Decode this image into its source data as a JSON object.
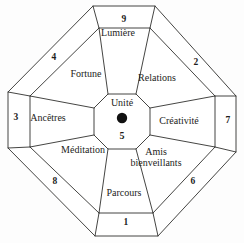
{
  "diagram": {
    "center": {
      "label": "Unité",
      "number": "5",
      "marker": "filled-dot"
    },
    "outer_numbers": [
      {
        "id": "north",
        "value": "9",
        "x": 124,
        "y": 20
      },
      {
        "id": "northeast",
        "value": "2",
        "x": 196,
        "y": 63
      },
      {
        "id": "east",
        "value": "7",
        "x": 228,
        "y": 121
      },
      {
        "id": "southeast",
        "value": "6",
        "x": 193,
        "y": 182
      },
      {
        "id": "south",
        "value": "1",
        "x": 126,
        "y": 223
      },
      {
        "id": "southwest",
        "value": "8",
        "x": 55,
        "y": 182
      },
      {
        "id": "west",
        "value": "3",
        "x": 16,
        "y": 118
      },
      {
        "id": "northwest",
        "value": "4",
        "x": 54,
        "y": 58
      }
    ],
    "sectors": [
      {
        "id": "north",
        "label": "Lumière",
        "x": 118,
        "y": 33,
        "two_line": false
      },
      {
        "id": "northeast",
        "label": "Relations",
        "x": 157,
        "y": 78,
        "two_line": false
      },
      {
        "id": "east",
        "label": "Créativité",
        "x": 179,
        "y": 121,
        "two_line": false
      },
      {
        "id": "southeast",
        "label": "Amis bienveillants",
        "x": 156,
        "y": 157,
        "two_line": true
      },
      {
        "id": "south",
        "label": "Parcours",
        "x": 124,
        "y": 193,
        "two_line": false
      },
      {
        "id": "southwest",
        "label": "Méditation",
        "x": 83,
        "y": 150,
        "two_line": false
      },
      {
        "id": "west",
        "label": "Ancêtres",
        "x": 48,
        "y": 118,
        "two_line": false
      },
      {
        "id": "northwest",
        "label": "Fortune",
        "x": 86,
        "y": 74,
        "two_line": false
      }
    ],
    "colors": {
      "stroke": "#30302e",
      "background": "#fdfdfd",
      "text": "#1d1d1b",
      "dot": "#111111"
    }
  }
}
